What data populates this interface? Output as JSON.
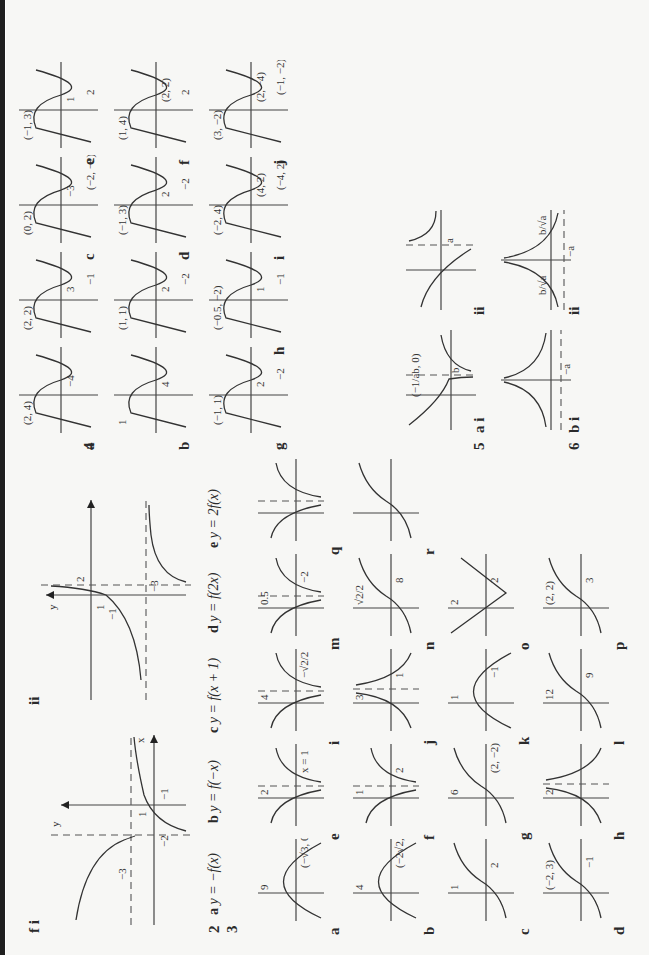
{
  "page": {
    "orientation": "rotated-90-ccw",
    "sections": {
      "f": {
        "label": "f i",
        "part_ii_label": "ii",
        "i": {
          "asymptotes": [
            "x = -2",
            "y = -3"
          ],
          "intercepts": [
            "1",
            "-1"
          ],
          "marks": [
            "-3",
            "-2",
            "1",
            "-1"
          ]
        },
        "ii": {
          "asymptotes": [
            "x = 2",
            "y = -3"
          ],
          "marks": [
            "1",
            "2",
            "-1",
            "-3"
          ]
        }
      },
      "q2": {
        "number": "2",
        "parts": [
          {
            "letter": "a",
            "text": "y = −f(x)"
          },
          {
            "letter": "b",
            "text": "y = f(−x)"
          },
          {
            "letter": "c",
            "text": "y = f(x + 1)"
          },
          {
            "letter": "d",
            "text": "y = f(2x)"
          },
          {
            "letter": "e",
            "text": "y = 2f(x)"
          }
        ]
      },
      "q3": {
        "number": "3",
        "graphs": [
          {
            "letter": "a",
            "labels": [
              "9",
              "(−√3, 0)",
              "(√3, 0)"
            ]
          },
          {
            "letter": "b",
            "labels": [
              "4",
              "(−2√2, 0)",
              "(2√2, 0)"
            ]
          },
          {
            "letter": "c",
            "labels": [
              "1",
              "2"
            ]
          },
          {
            "letter": "d",
            "labels": [
              "(−2, 3)",
              "−1"
            ]
          },
          {
            "letter": "e",
            "labels": [
              "2",
              "x = 1"
            ]
          },
          {
            "letter": "f",
            "labels": [
              "1",
              "2"
            ]
          },
          {
            "letter": "g",
            "labels": [
              "6",
              "(2, −2)"
            ]
          },
          {
            "letter": "h",
            "labels": [
              "2"
            ]
          },
          {
            "letter": "i",
            "labels": [
              "4",
              "−√2/2",
              "√2/2"
            ]
          },
          {
            "letter": "j",
            "labels": [
              "3",
              "1",
              "1"
            ]
          },
          {
            "letter": "k",
            "labels": [
              "1",
              "−1"
            ]
          },
          {
            "letter": "l",
            "labels": [
              "12",
              "9"
            ]
          },
          {
            "letter": "m",
            "labels": [
              "0.5",
              "−2"
            ]
          },
          {
            "letter": "n",
            "labels": [
              "√2/2",
              "8"
            ]
          },
          {
            "letter": "o",
            "labels": [
              "2",
              "2"
            ]
          },
          {
            "letter": "p",
            "labels": [
              "(2, 2)",
              "3"
            ]
          },
          {
            "letter": "q",
            "labels": []
          },
          {
            "letter": "r",
            "labels": []
          }
        ]
      },
      "q4": {
        "number": "4",
        "graphs": [
          {
            "letter": "a",
            "labels": [
              "(2, 4)",
              "−4"
            ]
          },
          {
            "letter": "b",
            "labels": [
              "1",
              "4"
            ]
          },
          {
            "letter": "",
            "labels": [
              "(2, 2)",
              "3",
              "−1",
              "(0, −2)"
            ]
          },
          {
            "letter": "",
            "labels": [
              "(1, 1)",
              "2",
              "−2",
              "(−1, −3)"
            ]
          },
          {
            "letter": "c",
            "labels": [
              "(0, 2)",
              "−3",
              "(−2, −2)"
            ]
          },
          {
            "letter": "d",
            "labels": [
              "(−1, 3)",
              "2",
              "−2",
              "(1, −1)"
            ]
          },
          {
            "letter": "e",
            "labels": [
              "(−1, 3)",
              "1",
              "2",
              "−2",
              "(1, −1)"
            ]
          },
          {
            "letter": "f",
            "labels": [
              "(1, 4)",
              "(2, 2)",
              "2",
              "(−2, 2)",
              "(−1, 0)"
            ]
          },
          {
            "letter": "g",
            "labels": [
              "(−1, 1)",
              "2",
              "−2",
              "(1, −1)"
            ]
          },
          {
            "letter": "h",
            "labels": [
              "(−0.5, −2)",
              "1",
              "−1",
              "(0.5, 2)"
            ]
          },
          {
            "letter": "i",
            "labels": [
              "(−2, 4)",
              "(4, 2)",
              "(−4, 2)",
              "(2, 0)"
            ]
          },
          {
            "letter": "j",
            "labels": [
              "(3, −2)",
              "(2, −4)",
              "(−1, −2)"
            ]
          }
        ]
      },
      "q5": {
        "number": "5",
        "parts": [
          {
            "letter": "a i",
            "labels": [
              "(−1/ab, 0)",
              "b"
            ]
          },
          {
            "letter": "ii",
            "labels": [
              "(0, b/a)",
              "a"
            ]
          }
        ]
      },
      "q6": {
        "number": "6",
        "parts": [
          {
            "letter": "b i",
            "labels": [
              "−a"
            ]
          },
          {
            "letter": "ii",
            "labels": [
              "b/√a",
              "−a",
              "b/√a"
            ]
          }
        ]
      }
    }
  }
}
